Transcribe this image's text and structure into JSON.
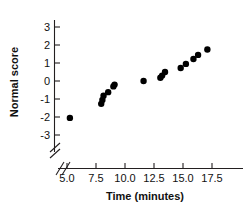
{
  "chart_data": {
    "type": "scatter",
    "title": "",
    "xlabel": "Time (minutes)",
    "ylabel": "Normal score",
    "xlim": [
      4.6,
      18.4
    ],
    "ylim": [
      -3.4,
      3.4
    ],
    "xticks": [
      5.0,
      7.5,
      10.0,
      12.5,
      15.0,
      17.5
    ],
    "xticklabels": [
      "5.0",
      "7.5",
      "10.0",
      "12.5",
      "15.0",
      "17.5"
    ],
    "yticks": [
      3,
      2,
      1,
      0,
      -1,
      -2,
      -3
    ],
    "yticklabels": [
      "3",
      "2",
      "1",
      "0",
      "-1",
      "-2",
      "-3"
    ],
    "grid": false,
    "legend": null,
    "axis_break": {
      "axis": "x",
      "symbol": "//",
      "note": "broken axis near origin"
    },
    "marker": {
      "shape": "circle",
      "color": "#000000",
      "size": 3.2
    },
    "x": [
      5.25,
      7.95,
      8.05,
      8.15,
      8.55,
      9.0,
      9.1,
      11.6,
      13.05,
      13.2,
      13.45,
      14.8,
      15.25,
      15.9,
      16.3,
      17.1
    ],
    "y": [
      -2.05,
      -1.27,
      -1.05,
      -0.82,
      -0.62,
      -0.3,
      -0.2,
      0.0,
      0.18,
      0.3,
      0.5,
      0.72,
      0.95,
      1.22,
      1.45,
      1.75
    ],
    "points": [
      {
        "x": 5.25,
        "y": -2.05
      },
      {
        "x": 7.95,
        "y": -1.27
      },
      {
        "x": 8.05,
        "y": -1.05
      },
      {
        "x": 8.15,
        "y": -0.82
      },
      {
        "x": 8.55,
        "y": -0.62
      },
      {
        "x": 9.0,
        "y": -0.3
      },
      {
        "x": 9.1,
        "y": -0.2
      },
      {
        "x": 11.6,
        "y": 0.0
      },
      {
        "x": 13.05,
        "y": 0.18
      },
      {
        "x": 13.2,
        "y": 0.3
      },
      {
        "x": 13.45,
        "y": 0.5
      },
      {
        "x": 14.8,
        "y": 0.72
      },
      {
        "x": 15.25,
        "y": 0.95
      },
      {
        "x": 15.9,
        "y": 1.22
      },
      {
        "x": 16.3,
        "y": 1.45
      },
      {
        "x": 17.1,
        "y": 1.75
      }
    ]
  },
  "colors": {
    "marker": "#000000",
    "axis": "#231f20",
    "text": "#111111",
    "background": "#ffffff"
  }
}
